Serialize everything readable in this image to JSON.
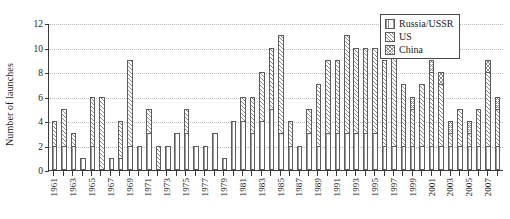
{
  "chart_data": {
    "type": "bar",
    "stacked": true,
    "title": "",
    "xlabel": "",
    "ylabel": "Number of launches",
    "ylim": [
      0,
      12
    ],
    "yticks": [
      0,
      2,
      4,
      6,
      8,
      10,
      12
    ],
    "grid": true,
    "legend_position": "top-right",
    "legend": [
      "Russia/USSR",
      "US",
      "China"
    ],
    "categories": [
      "1961",
      "1962",
      "1963",
      "1964",
      "1965",
      "1966",
      "1967",
      "1968",
      "1969",
      "1970",
      "1971",
      "1972",
      "1973",
      "1974",
      "1975",
      "1976",
      "1977",
      "1978",
      "1979",
      "1980",
      "1981",
      "1982",
      "1983",
      "1984",
      "1985",
      "1986",
      "1987",
      "1988",
      "1989",
      "1990",
      "1991",
      "1992",
      "1993",
      "1994",
      "1995",
      "1996",
      "1997",
      "1998",
      "1999",
      "2000",
      "2001",
      "2002",
      "2003",
      "2004",
      "2005",
      "2006",
      "2007",
      "2008"
    ],
    "tick_labels": [
      "1961",
      "",
      "1963",
      "",
      "1965",
      "",
      "1967",
      "",
      "1969",
      "",
      "1971",
      "",
      "1973",
      "",
      "1975",
      "",
      "1977",
      "",
      "1979",
      "",
      "1981",
      "",
      "1983",
      "",
      "1985",
      "",
      "1987",
      "",
      "1989",
      "",
      "1991",
      "",
      "1993",
      "",
      "1995",
      "",
      "1997",
      "",
      "1999",
      "",
      "2001",
      "",
      "2003",
      "",
      "2005",
      "",
      "2007",
      ""
    ],
    "series": [
      {
        "name": "Russia/USSR",
        "values": [
          2,
          2,
          2,
          1,
          2,
          0,
          1,
          1,
          2,
          2,
          3,
          0,
          2,
          3,
          3,
          2,
          2,
          3,
          1,
          4,
          4,
          3,
          4,
          5,
          3,
          2,
          2,
          3,
          2,
          3,
          3,
          3,
          3,
          3,
          3,
          2,
          2,
          2,
          2,
          2,
          2,
          2,
          2,
          2,
          2,
          2,
          2,
          2
        ]
      },
      {
        "name": "US",
        "values": [
          2,
          3,
          1,
          0,
          4,
          6,
          0,
          3,
          7,
          0,
          2,
          2,
          0,
          0,
          2,
          0,
          0,
          0,
          0,
          0,
          2,
          3,
          4,
          5,
          8,
          2,
          0,
          2,
          5,
          6,
          6,
          8,
          7,
          7,
          7,
          7,
          8,
          5,
          3,
          5,
          6,
          5,
          1,
          3,
          1,
          3,
          6,
          3
        ]
      },
      {
        "name": "China",
        "values": [
          0,
          0,
          0,
          0,
          0,
          0,
          0,
          0,
          0,
          0,
          0,
          0,
          0,
          0,
          0,
          0,
          0,
          0,
          0,
          0,
          0,
          0,
          0,
          0,
          0,
          0,
          0,
          0,
          0,
          0,
          0,
          0,
          0,
          0,
          0,
          0,
          0,
          0,
          1,
          0,
          1,
          1,
          1,
          0,
          1,
          0,
          1,
          1
        ]
      }
    ],
    "totals": [
      4,
      5,
      3,
      1,
      6,
      6,
      1,
      4,
      9,
      2,
      5,
      2,
      2,
      3,
      5,
      2,
      2,
      3,
      1,
      6,
      6,
      6,
      8,
      10,
      11,
      4,
      2,
      5,
      7,
      9,
      9,
      11,
      10,
      10,
      10,
      9,
      10,
      7,
      6,
      7,
      9,
      8,
      4,
      5,
      4,
      5,
      9,
      6
    ]
  }
}
